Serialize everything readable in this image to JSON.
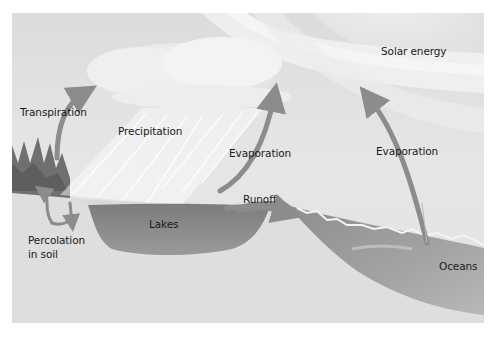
{
  "diagram": {
    "colors": {
      "sky": "#e4e4e4",
      "ground": "#dcdcdc",
      "water": "#8a8a8a",
      "arrow": "#8c8c8c",
      "trees": "#6e6e6e",
      "text": "#1a1a1a"
    },
    "labels": {
      "solar_energy": "Solar energy",
      "transpiration": "Transpiration",
      "precipitation": "Precipitation",
      "evaporation_lake": "Evaporation",
      "evaporation_ocean": "Evaporation",
      "runoff": "Runoff",
      "lakes": "Lakes",
      "percolation_line1": "Percolation",
      "percolation_line2": "in soil",
      "oceans": "Oceans"
    },
    "elements": [
      {
        "id": "sun-rays",
        "type": "light-beams"
      },
      {
        "id": "cloud",
        "type": "shape"
      },
      {
        "id": "rain",
        "type": "streaks"
      },
      {
        "id": "trees",
        "type": "shape"
      },
      {
        "id": "lake",
        "type": "water-body"
      },
      {
        "id": "ocean",
        "type": "water-body"
      }
    ],
    "arrows": [
      {
        "id": "transpiration-arrow",
        "from": "trees",
        "to": "cloud"
      },
      {
        "id": "evaporation-lake-arrow",
        "from": "lake",
        "to": "cloud"
      },
      {
        "id": "evaporation-ocean-arrow",
        "from": "ocean",
        "to": "cloud"
      },
      {
        "id": "runoff-arrow",
        "from": "lake",
        "to": "ocean"
      },
      {
        "id": "percolation-arrows",
        "from": "surface",
        "to": "soil"
      }
    ]
  }
}
